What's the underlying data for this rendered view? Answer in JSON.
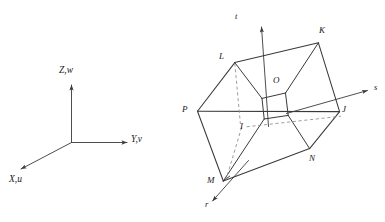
{
  "figure": {
    "type": "technical-line-diagram",
    "background_color": "#ffffff",
    "line_color": "#3a3a3a",
    "label_color": "#1a1a1a",
    "global_axes": {
      "name": "global-coordinate-system",
      "labels": {
        "z": "Z,w",
        "y": "Y,v",
        "x": "X,u"
      }
    },
    "solid": {
      "name": "parallelepiped",
      "local_axes": {
        "t": "t",
        "s": "s",
        "r": "r"
      },
      "vertices": {
        "P": "P",
        "L": "L",
        "K": "K",
        "J": "J",
        "N": "N",
        "M": "M",
        "I": "I",
        "O": "O"
      }
    }
  }
}
